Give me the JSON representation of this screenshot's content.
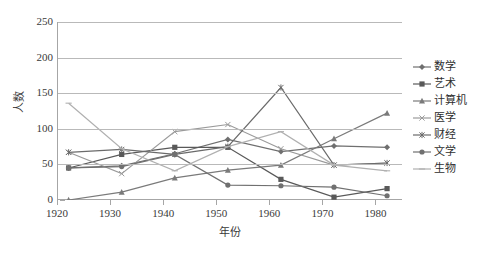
{
  "chart_data": {
    "type": "line",
    "title": "",
    "xlabel": "年份",
    "ylabel": "人数",
    "xlim": [
      1920,
      1985
    ],
    "ylim": [
      0,
      250
    ],
    "ytick_step": 50,
    "grid": true,
    "legend_position": "right",
    "x": [
      1922,
      1932,
      1942,
      1952,
      1962,
      1972,
      1982
    ],
    "categories": [
      "1920",
      "1930",
      "1940",
      "1950",
      "1960",
      "1970",
      "1980"
    ],
    "yticks": [
      "0",
      "50",
      "100",
      "150",
      "200",
      "250"
    ],
    "series": [
      {
        "name": "数学",
        "color": "#6f6f6f",
        "marker": "diamond",
        "values": [
          45,
          48,
          65,
          85,
          68,
          76,
          74
        ]
      },
      {
        "name": "艺术",
        "color": "#595959",
        "marker": "square",
        "values": [
          45,
          64,
          74,
          74,
          29,
          4,
          16
        ]
      },
      {
        "name": "计算机",
        "color": "#7a7a7a",
        "marker": "triangle",
        "values": [
          0,
          11,
          31,
          42,
          49,
          86,
          122
        ]
      },
      {
        "name": "医学",
        "color": "#9a9a9a",
        "marker": "cross",
        "values": [
          67,
          37,
          96,
          106,
          72,
          49,
          52
        ]
      },
      {
        "name": "财经",
        "color": "#6b6b6b",
        "marker": "star",
        "values": [
          67,
          71,
          64,
          75,
          158,
          49,
          52
        ]
      },
      {
        "name": "文学",
        "color": "#707070",
        "marker": "circle",
        "values": [
          45,
          47,
          64,
          21,
          20,
          18,
          6
        ]
      },
      {
        "name": "生物",
        "color": "#b0b0b0",
        "marker": "line",
        "values": [
          136,
          72,
          41,
          75,
          96,
          49,
          41
        ]
      }
    ]
  }
}
